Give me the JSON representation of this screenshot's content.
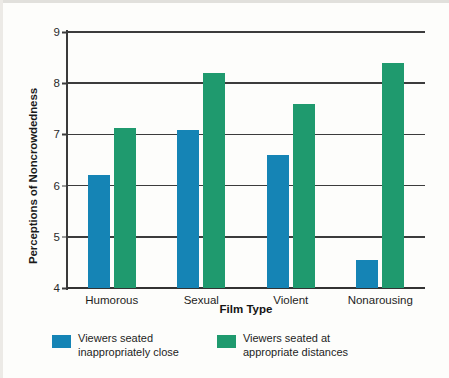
{
  "chart_data": {
    "type": "bar",
    "title": "",
    "subtitle": "",
    "xlabel": "Film Type",
    "ylabel": "Perceptions of Noncrowdedness",
    "categories": [
      "Humorous",
      "Sexual",
      "Violent",
      "Nonarousing"
    ],
    "ylim": [
      4,
      9
    ],
    "yticks": [
      4,
      5,
      6,
      7,
      8,
      9
    ],
    "grid": "horizontal",
    "legend_position": "bottom-left",
    "series": [
      {
        "name": "Viewers seated inappropriately close",
        "color": "#1584b5",
        "values": [
          6.2,
          7.08,
          6.6,
          4.55
        ]
      },
      {
        "name": "Viewers seated at appropriate distances",
        "color": "#1f9a6e",
        "values": [
          7.12,
          8.2,
          7.6,
          8.4
        ]
      }
    ]
  },
  "legend": {
    "items": [
      {
        "label": "Viewers seated\ninappropriately close",
        "color": "#1584b5",
        "swatch": "blue"
      },
      {
        "label": "Viewers seated at\nappropriate distances",
        "color": "#1f9a6e",
        "swatch": "green"
      }
    ]
  }
}
